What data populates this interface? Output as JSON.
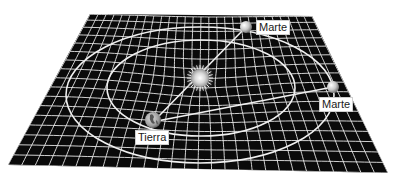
{
  "diagram": {
    "title": "",
    "plane": {
      "color": "#0a0a0a",
      "grid_color": "#e8e8e8",
      "corners": [
        [
          90,
          14
        ],
        [
          312,
          16
        ],
        [
          388,
          173
        ],
        [
          8,
          165
        ]
      ]
    },
    "sun": {
      "name": "Sol",
      "x": 200,
      "y": 78,
      "r": 10
    },
    "earth": {
      "label": "Tierra",
      "x": 153,
      "y": 120,
      "r": 8
    },
    "mars_positions": [
      {
        "label": "Marte",
        "x": 246,
        "y": 27,
        "r": 6
      },
      {
        "label": "Marte",
        "x": 333,
        "y": 87,
        "r": 6
      }
    ],
    "orbits": {
      "inner": {
        "cx": 201,
        "cy": 88,
        "rx": 94,
        "ry": 48
      },
      "outer": {
        "cx": 200,
        "cy": 95,
        "rx": 134,
        "ry": 68
      }
    },
    "lines": [
      {
        "from": "earth",
        "to": "mars_top"
      },
      {
        "from": "earth",
        "to": "mars_right"
      }
    ]
  },
  "labels": {
    "earth": "Tierra",
    "mars_top": "Marte",
    "mars_right": "Marte"
  }
}
